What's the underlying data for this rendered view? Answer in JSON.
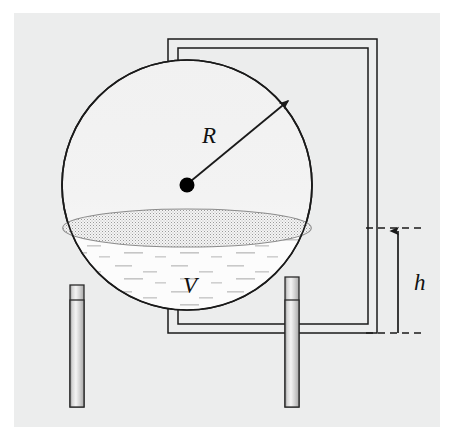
{
  "figure": {
    "canvas": {
      "width": 459,
      "height": 447
    },
    "background": {
      "page_color": "#ffffff",
      "plate_color": "#eceded",
      "plate_rect": {
        "x": 14,
        "y": 13,
        "width": 426,
        "height": 414
      }
    },
    "stroke_color": "#1a1a1a",
    "labels": {
      "radius": "R",
      "volume": "V",
      "height": "h"
    },
    "sphere": {
      "name": "tank-sphere",
      "center_x": 187,
      "center_y": 185,
      "radius": 125,
      "fill": "#f2f2f2",
      "stroke": "#1a1a1a",
      "stroke_width": 1.6
    },
    "center_dot": {
      "name": "sphere-center-dot",
      "x": 187,
      "y": 185,
      "r": 7.5,
      "fill": "#000000"
    },
    "radius_arrow": {
      "name": "radius-arrow",
      "x1": 190,
      "y1": 181,
      "x2": 291,
      "y2": 98,
      "label_x": 209,
      "label_y": 140,
      "font_size": 22
    },
    "liquid": {
      "name": "liquid-body",
      "surface_y": 228,
      "surface_ellipse_rx": 124.5,
      "surface_ellipse_ry": 19,
      "fill": "#fbfbfb",
      "surface_fill": "#dcdcdc",
      "label_x": 190,
      "label_y": 292,
      "font_size": 22
    },
    "frame": {
      "name": "support-frame",
      "outer": {
        "x": 168,
        "y": 39,
        "width": 209,
        "height": 294
      },
      "inner": {
        "x": 178,
        "y": 48,
        "width": 190,
        "height": 276
      },
      "stroke_width": 1.5
    },
    "legs": [
      {
        "name": "leg-left",
        "x": 70,
        "y_top": 285,
        "width": 14,
        "height": 122
      },
      {
        "name": "leg-right",
        "x": 285,
        "y_top": 277,
        "width": 14,
        "height": 130
      }
    ],
    "dimension": {
      "name": "height-dimension",
      "top_y": 228,
      "bottom_y": 333,
      "dash_x_start": 368,
      "dash_x_end": 424,
      "arrow_x": 398,
      "label_x": 412,
      "label_y": 288,
      "font_size": 22,
      "dash_pattern": "7,5"
    }
  }
}
